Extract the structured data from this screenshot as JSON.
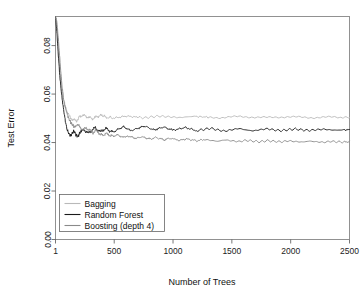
{
  "chart_data": {
    "type": "line",
    "title": "",
    "xlabel": "Number of Trees",
    "ylabel": "Test Error",
    "xlim": [
      1,
      2500
    ],
    "ylim": [
      0.0,
      0.092
    ],
    "xticks": [
      1,
      500,
      1000,
      1500,
      2000,
      2500
    ],
    "xticklabels": [
      "1",
      "500",
      "1000",
      "1500",
      "2000",
      "2500"
    ],
    "yticks": [
      0.0,
      0.02,
      0.04,
      0.06,
      0.08
    ],
    "yticklabels": [
      "0.00",
      "0.02",
      "0.04",
      "0.06",
      "0.08"
    ],
    "grid": false,
    "legend_position": "bottom-left",
    "series": [
      {
        "name": "Bagging",
        "color": "#b9b9b9",
        "x": [
          1,
          12,
          25,
          40,
          55,
          70,
          85,
          100,
          120,
          140,
          160,
          180,
          200,
          230,
          260,
          290,
          320,
          350,
          380,
          410,
          450,
          500,
          550,
          600,
          650,
          700,
          760,
          820,
          880,
          940,
          1000,
          1060,
          1120,
          1180,
          1250,
          1320,
          1400,
          1480,
          1560,
          1640,
          1720,
          1800,
          1880,
          1960,
          2040,
          2120,
          2200,
          2280,
          2360,
          2440,
          2500
        ],
        "y": [
          0.092,
          0.088,
          0.079,
          0.069,
          0.062,
          0.057,
          0.0545,
          0.0525,
          0.0508,
          0.0497,
          0.0492,
          0.0489,
          0.0505,
          0.0513,
          0.0508,
          0.0502,
          0.0499,
          0.0506,
          0.0512,
          0.0508,
          0.0503,
          0.0501,
          0.0505,
          0.0509,
          0.0507,
          0.0504,
          0.0502,
          0.0506,
          0.0509,
          0.0507,
          0.0505,
          0.0503,
          0.0506,
          0.0508,
          0.0506,
          0.0504,
          0.0503,
          0.0505,
          0.0507,
          0.0506,
          0.0504,
          0.0503,
          0.0505,
          0.0506,
          0.0505,
          0.0504,
          0.0503,
          0.0504,
          0.0505,
          0.0504,
          0.0504
        ]
      },
      {
        "name": "Random Forest",
        "color": "#1a1a1a",
        "x": [
          1,
          12,
          25,
          40,
          55,
          70,
          85,
          100,
          115,
          130,
          145,
          160,
          175,
          190,
          205,
          220,
          240,
          260,
          280,
          300,
          320,
          340,
          360,
          380,
          400,
          430,
          460,
          490,
          520,
          550,
          580,
          610,
          640,
          680,
          720,
          760,
          800,
          840,
          880,
          920,
          960,
          1000,
          1050,
          1100,
          1150,
          1200,
          1260,
          1320,
          1380,
          1440,
          1500,
          1560,
          1620,
          1680,
          1740,
          1800,
          1860,
          1920,
          1980,
          2040,
          2100,
          2160,
          2220,
          2280,
          2340,
          2400,
          2460,
          2500
        ],
        "y": [
          0.092,
          0.086,
          0.076,
          0.066,
          0.059,
          0.0535,
          0.0488,
          0.0452,
          0.0437,
          0.0428,
          0.0441,
          0.0447,
          0.0432,
          0.0424,
          0.0437,
          0.0445,
          0.0452,
          0.0447,
          0.0438,
          0.0446,
          0.0455,
          0.0461,
          0.0452,
          0.0444,
          0.0451,
          0.0458,
          0.0449,
          0.0442,
          0.0451,
          0.0459,
          0.0465,
          0.0457,
          0.0449,
          0.0455,
          0.0462,
          0.0468,
          0.0459,
          0.0452,
          0.0458,
          0.0464,
          0.0457,
          0.0451,
          0.0456,
          0.0462,
          0.0456,
          0.0449,
          0.0454,
          0.0459,
          0.0452,
          0.0447,
          0.0453,
          0.0458,
          0.0452,
          0.0448,
          0.0453,
          0.0457,
          0.0452,
          0.0449,
          0.0453,
          0.0456,
          0.0452,
          0.045,
          0.0453,
          0.0455,
          0.0452,
          0.0451,
          0.0453,
          0.0452
        ]
      },
      {
        "name": "Boosting (depth 4)",
        "color": "#8a8a8a",
        "x": [
          1,
          12,
          25,
          40,
          55,
          70,
          85,
          100,
          115,
          130,
          145,
          160,
          180,
          200,
          220,
          240,
          260,
          280,
          300,
          320,
          340,
          360,
          380,
          400,
          430,
          460,
          490,
          520,
          550,
          580,
          610,
          650,
          690,
          730,
          770,
          810,
          850,
          890,
          930,
          970,
          1010,
          1060,
          1110,
          1160,
          1210,
          1260,
          1320,
          1380,
          1440,
          1500,
          1560,
          1620,
          1680,
          1740,
          1800,
          1860,
          1920,
          1980,
          2040,
          2100,
          2160,
          2220,
          2280,
          2340,
          2400,
          2460,
          2500
        ],
        "y": [
          0.092,
          0.09,
          0.083,
          0.073,
          0.064,
          0.058,
          0.0545,
          0.0518,
          0.0498,
          0.0483,
          0.0472,
          0.0466,
          0.0473,
          0.0468,
          0.0459,
          0.0452,
          0.0461,
          0.0455,
          0.0447,
          0.0441,
          0.0449,
          0.0443,
          0.0436,
          0.043,
          0.0437,
          0.0431,
          0.0425,
          0.0432,
          0.0427,
          0.0421,
          0.0428,
          0.0422,
          0.0417,
          0.0424,
          0.0419,
          0.0414,
          0.0421,
          0.0416,
          0.0411,
          0.0418,
          0.0413,
          0.0409,
          0.0415,
          0.0411,
          0.0407,
          0.0413,
          0.0409,
          0.0405,
          0.0411,
          0.0407,
          0.0404,
          0.0409,
          0.0406,
          0.0403,
          0.0408,
          0.0405,
          0.0403,
          0.0407,
          0.0404,
          0.0402,
          0.0406,
          0.0403,
          0.0401,
          0.0405,
          0.0403,
          0.0402,
          0.0404
        ]
      }
    ],
    "legend_entries": [
      "Bagging",
      "Random Forest",
      "Boosting (depth 4)"
    ]
  }
}
